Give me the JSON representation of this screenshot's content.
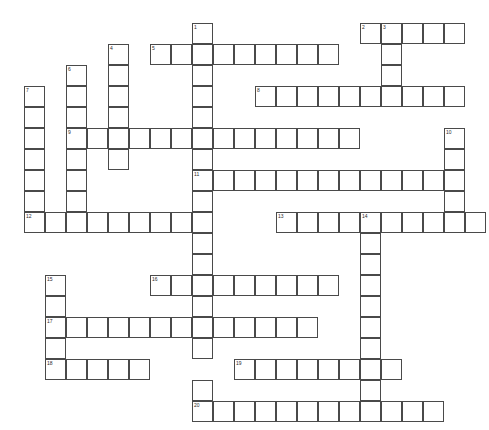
{
  "puzzle": {
    "title": "Crossword Grid",
    "cell_size": 21,
    "origin": {
      "x": 24,
      "y": 23
    },
    "grid_cols": 22,
    "grid_rows": 19,
    "colors": {
      "cell_border": "#4a4a4a",
      "cell_fill": "#ffffff",
      "number": "#2b2b2b",
      "background": "#ffffff"
    },
    "entries": [
      {
        "number": 1,
        "direction": "down",
        "col": 8,
        "row": 0,
        "length": 8
      },
      {
        "number": 2,
        "direction": "across",
        "col": 16,
        "row": 0,
        "length": 5
      },
      {
        "number": 3,
        "direction": "down",
        "col": 17,
        "row": 0,
        "length": 6
      },
      {
        "number": 4,
        "direction": "down",
        "col": 4,
        "row": 1,
        "length": 6
      },
      {
        "number": 5,
        "direction": "across",
        "col": 6,
        "row": 1,
        "length": 9
      },
      {
        "number": 6,
        "direction": "down",
        "col": 2,
        "row": 2,
        "length": 9
      },
      {
        "number": 7,
        "direction": "down",
        "col": 0,
        "row": 3,
        "length": 7
      },
      {
        "number": 8,
        "direction": "across",
        "col": 11,
        "row": 3,
        "length": 10
      },
      {
        "number": 9,
        "direction": "across",
        "col": 2,
        "row": 5,
        "length": 14
      },
      {
        "number": 10,
        "direction": "down",
        "col": 20,
        "row": 5,
        "length": 8
      },
      {
        "number": 11,
        "direction": "across",
        "col": 8,
        "row": 7,
        "length": 12
      },
      {
        "number": 12,
        "direction": "across",
        "col": 0,
        "row": 9,
        "length": 8
      },
      {
        "number": 13,
        "direction": "across",
        "col": 12,
        "row": 9,
        "length": 10
      },
      {
        "number": 14,
        "direction": "down",
        "col": 16,
        "row": 9,
        "length": 10
      },
      {
        "number": 15,
        "direction": "down",
        "col": 1,
        "row": 12,
        "length": 6
      },
      {
        "number": 16,
        "direction": "across",
        "col": 6,
        "row": 12,
        "length": 9
      },
      {
        "number": 17,
        "direction": "across",
        "col": 1,
        "row": 14,
        "length": 13
      },
      {
        "number": 18,
        "direction": "across",
        "col": 1,
        "row": 16,
        "length": 5
      },
      {
        "number": 19,
        "direction": "across",
        "col": 10,
        "row": 16,
        "length": 8
      },
      {
        "number": 20,
        "direction": "across",
        "col": 8,
        "row": 18,
        "length": 12
      }
    ],
    "cells": [
      {
        "col": 8,
        "row": 0,
        "num": 1
      },
      {
        "col": 16,
        "row": 0,
        "num": 2
      },
      {
        "col": 17,
        "row": 0,
        "num": 3
      },
      {
        "col": 18,
        "row": 0,
        "num": null
      },
      {
        "col": 19,
        "row": 0,
        "num": null
      },
      {
        "col": 20,
        "row": 0,
        "num": null
      },
      {
        "col": 4,
        "row": 1,
        "num": 4
      },
      {
        "col": 6,
        "row": 1,
        "num": 5
      },
      {
        "col": 7,
        "row": 1,
        "num": null
      },
      {
        "col": 8,
        "row": 1,
        "num": null
      },
      {
        "col": 9,
        "row": 1,
        "num": null
      },
      {
        "col": 10,
        "row": 1,
        "num": null
      },
      {
        "col": 11,
        "row": 1,
        "num": null
      },
      {
        "col": 12,
        "row": 1,
        "num": null
      },
      {
        "col": 13,
        "row": 1,
        "num": null
      },
      {
        "col": 14,
        "row": 1,
        "num": null
      },
      {
        "col": 17,
        "row": 1,
        "num": null
      },
      {
        "col": 2,
        "row": 2,
        "num": 6
      },
      {
        "col": 4,
        "row": 2,
        "num": null
      },
      {
        "col": 8,
        "row": 2,
        "num": null
      },
      {
        "col": 17,
        "row": 2,
        "num": null
      },
      {
        "col": 0,
        "row": 3,
        "num": 7
      },
      {
        "col": 2,
        "row": 3,
        "num": null
      },
      {
        "col": 4,
        "row": 3,
        "num": null
      },
      {
        "col": 8,
        "row": 3,
        "num": null
      },
      {
        "col": 11,
        "row": 3,
        "num": 8
      },
      {
        "col": 12,
        "row": 3,
        "num": null
      },
      {
        "col": 13,
        "row": 3,
        "num": null
      },
      {
        "col": 14,
        "row": 3,
        "num": null
      },
      {
        "col": 15,
        "row": 3,
        "num": null
      },
      {
        "col": 16,
        "row": 3,
        "num": null
      },
      {
        "col": 17,
        "row": 3,
        "num": null
      },
      {
        "col": 18,
        "row": 3,
        "num": null
      },
      {
        "col": 19,
        "row": 3,
        "num": null
      },
      {
        "col": 20,
        "row": 3,
        "num": null
      },
      {
        "col": 0,
        "row": 4,
        "num": null
      },
      {
        "col": 2,
        "row": 4,
        "num": null
      },
      {
        "col": 4,
        "row": 4,
        "num": null
      },
      {
        "col": 8,
        "row": 4,
        "num": null
      },
      {
        "col": 0,
        "row": 5,
        "num": null
      },
      {
        "col": 2,
        "row": 5,
        "num": 9
      },
      {
        "col": 3,
        "row": 5,
        "num": null
      },
      {
        "col": 4,
        "row": 5,
        "num": null
      },
      {
        "col": 5,
        "row": 5,
        "num": null
      },
      {
        "col": 6,
        "row": 5,
        "num": null
      },
      {
        "col": 7,
        "row": 5,
        "num": null
      },
      {
        "col": 8,
        "row": 5,
        "num": null
      },
      {
        "col": 9,
        "row": 5,
        "num": null
      },
      {
        "col": 10,
        "row": 5,
        "num": null
      },
      {
        "col": 11,
        "row": 5,
        "num": null
      },
      {
        "col": 12,
        "row": 5,
        "num": null
      },
      {
        "col": 13,
        "row": 5,
        "num": null
      },
      {
        "col": 14,
        "row": 5,
        "num": null
      },
      {
        "col": 15,
        "row": 5,
        "num": null
      },
      {
        "col": 20,
        "row": 5,
        "num": 10
      },
      {
        "col": 0,
        "row": 6,
        "num": null
      },
      {
        "col": 2,
        "row": 6,
        "num": null
      },
      {
        "col": 4,
        "row": 6,
        "num": null
      },
      {
        "col": 8,
        "row": 6,
        "num": null
      },
      {
        "col": 20,
        "row": 6,
        "num": null
      },
      {
        "col": 0,
        "row": 7,
        "num": null
      },
      {
        "col": 2,
        "row": 7,
        "num": null
      },
      {
        "col": 8,
        "row": 7,
        "num": 11
      },
      {
        "col": 9,
        "row": 7,
        "num": null
      },
      {
        "col": 10,
        "row": 7,
        "num": null
      },
      {
        "col": 11,
        "row": 7,
        "num": null
      },
      {
        "col": 12,
        "row": 7,
        "num": null
      },
      {
        "col": 13,
        "row": 7,
        "num": null
      },
      {
        "col": 14,
        "row": 7,
        "num": null
      },
      {
        "col": 15,
        "row": 7,
        "num": null
      },
      {
        "col": 16,
        "row": 7,
        "num": null
      },
      {
        "col": 17,
        "row": 7,
        "num": null
      },
      {
        "col": 18,
        "row": 7,
        "num": null
      },
      {
        "col": 19,
        "row": 7,
        "num": null
      },
      {
        "col": 20,
        "row": 7,
        "num": null
      },
      {
        "col": 0,
        "row": 8,
        "num": null
      },
      {
        "col": 2,
        "row": 8,
        "num": null
      },
      {
        "col": 8,
        "row": 8,
        "num": null
      },
      {
        "col": 20,
        "row": 8,
        "num": null
      },
      {
        "col": 0,
        "row": 9,
        "num": 12
      },
      {
        "col": 1,
        "row": 9,
        "num": null
      },
      {
        "col": 2,
        "row": 9,
        "num": null
      },
      {
        "col": 3,
        "row": 9,
        "num": null
      },
      {
        "col": 4,
        "row": 9,
        "num": null
      },
      {
        "col": 5,
        "row": 9,
        "num": null
      },
      {
        "col": 6,
        "row": 9,
        "num": null
      },
      {
        "col": 7,
        "row": 9,
        "num": null
      },
      {
        "col": 8,
        "row": 9,
        "num": null
      },
      {
        "col": 12,
        "row": 9,
        "num": 13
      },
      {
        "col": 13,
        "row": 9,
        "num": null
      },
      {
        "col": 14,
        "row": 9,
        "num": null
      },
      {
        "col": 15,
        "row": 9,
        "num": null
      },
      {
        "col": 16,
        "row": 9,
        "num": 14
      },
      {
        "col": 17,
        "row": 9,
        "num": null
      },
      {
        "col": 18,
        "row": 9,
        "num": null
      },
      {
        "col": 19,
        "row": 9,
        "num": null
      },
      {
        "col": 20,
        "row": 9,
        "num": null
      },
      {
        "col": 21,
        "row": 9,
        "num": null
      },
      {
        "col": 8,
        "row": 10,
        "num": null
      },
      {
        "col": 16,
        "row": 10,
        "num": null
      },
      {
        "col": 8,
        "row": 11,
        "num": null
      },
      {
        "col": 16,
        "row": 11,
        "num": null
      },
      {
        "col": 1,
        "row": 12,
        "num": 15
      },
      {
        "col": 6,
        "row": 12,
        "num": 16
      },
      {
        "col": 7,
        "row": 12,
        "num": null
      },
      {
        "col": 8,
        "row": 12,
        "num": null
      },
      {
        "col": 9,
        "row": 12,
        "num": null
      },
      {
        "col": 10,
        "row": 12,
        "num": null
      },
      {
        "col": 11,
        "row": 12,
        "num": null
      },
      {
        "col": 12,
        "row": 12,
        "num": null
      },
      {
        "col": 13,
        "row": 12,
        "num": null
      },
      {
        "col": 14,
        "row": 12,
        "num": null
      },
      {
        "col": 16,
        "row": 12,
        "num": null
      },
      {
        "col": 1,
        "row": 13,
        "num": null
      },
      {
        "col": 8,
        "row": 13,
        "num": null
      },
      {
        "col": 16,
        "row": 13,
        "num": null
      },
      {
        "col": 1,
        "row": 14,
        "num": 17
      },
      {
        "col": 2,
        "row": 14,
        "num": null
      },
      {
        "col": 3,
        "row": 14,
        "num": null
      },
      {
        "col": 4,
        "row": 14,
        "num": null
      },
      {
        "col": 5,
        "row": 14,
        "num": null
      },
      {
        "col": 6,
        "row": 14,
        "num": null
      },
      {
        "col": 7,
        "row": 14,
        "num": null
      },
      {
        "col": 8,
        "row": 14,
        "num": null
      },
      {
        "col": 9,
        "row": 14,
        "num": null
      },
      {
        "col": 10,
        "row": 14,
        "num": null
      },
      {
        "col": 11,
        "row": 14,
        "num": null
      },
      {
        "col": 12,
        "row": 14,
        "num": null
      },
      {
        "col": 13,
        "row": 14,
        "num": null
      },
      {
        "col": 16,
        "row": 14,
        "num": null
      },
      {
        "col": 1,
        "row": 15,
        "num": null
      },
      {
        "col": 8,
        "row": 15,
        "num": null
      },
      {
        "col": 16,
        "row": 15,
        "num": null
      },
      {
        "col": 1,
        "row": 16,
        "num": 18
      },
      {
        "col": 2,
        "row": 16,
        "num": null
      },
      {
        "col": 3,
        "row": 16,
        "num": null
      },
      {
        "col": 4,
        "row": 16,
        "num": null
      },
      {
        "col": 5,
        "row": 16,
        "num": null
      },
      {
        "col": 10,
        "row": 16,
        "num": 19
      },
      {
        "col": 11,
        "row": 16,
        "num": null
      },
      {
        "col": 12,
        "row": 16,
        "num": null
      },
      {
        "col": 13,
        "row": 16,
        "num": null
      },
      {
        "col": 14,
        "row": 16,
        "num": null
      },
      {
        "col": 15,
        "row": 16,
        "num": null
      },
      {
        "col": 16,
        "row": 16,
        "num": null
      },
      {
        "col": 17,
        "row": 16,
        "num": null
      },
      {
        "col": 8,
        "row": 17,
        "num": null
      },
      {
        "col": 16,
        "row": 17,
        "num": null
      },
      {
        "col": 8,
        "row": 18,
        "num": 20
      },
      {
        "col": 9,
        "row": 18,
        "num": null
      },
      {
        "col": 10,
        "row": 18,
        "num": null
      },
      {
        "col": 11,
        "row": 18,
        "num": null
      },
      {
        "col": 12,
        "row": 18,
        "num": null
      },
      {
        "col": 13,
        "row": 18,
        "num": null
      },
      {
        "col": 14,
        "row": 18,
        "num": null
      },
      {
        "col": 15,
        "row": 18,
        "num": null
      },
      {
        "col": 16,
        "row": 18,
        "num": null
      },
      {
        "col": 17,
        "row": 18,
        "num": null
      },
      {
        "col": 18,
        "row": 18,
        "num": null
      },
      {
        "col": 19,
        "row": 18,
        "num": null
      }
    ]
  }
}
